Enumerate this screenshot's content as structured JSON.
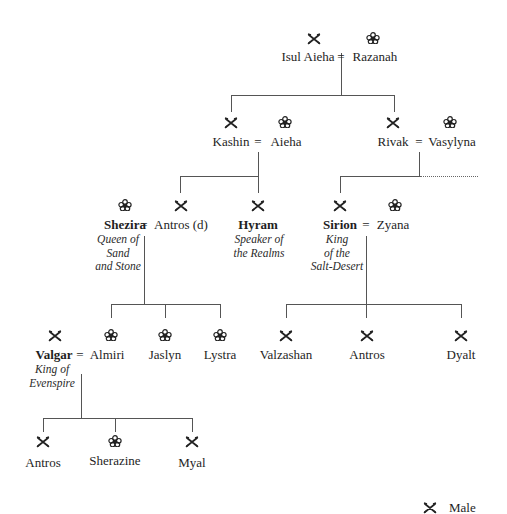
{
  "symbols": {
    "male": "crossed-swords",
    "female": "flower"
  },
  "legend": {
    "male_label": "Male"
  },
  "gen1": {
    "p1": {
      "name": "Isul Aieha",
      "sex": "male"
    },
    "p2": {
      "name": "Razanah",
      "sex": "female"
    },
    "marriage": "="
  },
  "gen2": {
    "kashin": {
      "name": "Kashin",
      "sex": "male"
    },
    "aieha": {
      "name": "Aieha",
      "sex": "female"
    },
    "kashin_marriage": "=",
    "rivak": {
      "name": "Rivak",
      "sex": "male"
    },
    "vasylyna": {
      "name": "Vasylyna",
      "sex": "female"
    },
    "rivak_marriage": "="
  },
  "gen3": {
    "shezira": {
      "name": "Shezira",
      "sex": "female",
      "title_lines": [
        "Queen of",
        "Sand",
        "and Stone"
      ]
    },
    "antros_d": {
      "name": "Antros (d)",
      "sex": "male"
    },
    "shezira_marriage": "=",
    "hyram": {
      "name": "Hyram",
      "sex": "male",
      "title_lines": [
        "Speaker of",
        "the Realms"
      ]
    },
    "sirion": {
      "name": "Sirion",
      "sex": "male",
      "title_lines": [
        "King",
        "of the",
        "Salt-Desert"
      ]
    },
    "zyana": {
      "name": "Zyana",
      "sex": "female"
    },
    "sirion_marriage": "="
  },
  "gen4": {
    "valgar": {
      "name": "Valgar",
      "sex": "male",
      "title_lines": [
        "King of",
        "Evenspire"
      ]
    },
    "almiri": {
      "name": "Almiri",
      "sex": "female"
    },
    "valgar_marriage": "=",
    "jaslyn": {
      "name": "Jaslyn",
      "sex": "female"
    },
    "lystra": {
      "name": "Lystra",
      "sex": "female"
    },
    "valzashan": {
      "name": "Valzashan",
      "sex": "male"
    },
    "antros": {
      "name": "Antros",
      "sex": "male"
    },
    "dyalt": {
      "name": "Dyalt",
      "sex": "male"
    }
  },
  "gen5": {
    "antros": {
      "name": "Antros",
      "sex": "male"
    },
    "sherazine": {
      "name": "Sherazine",
      "sex": "female"
    },
    "myal": {
      "name": "Myal",
      "sex": "male"
    }
  }
}
